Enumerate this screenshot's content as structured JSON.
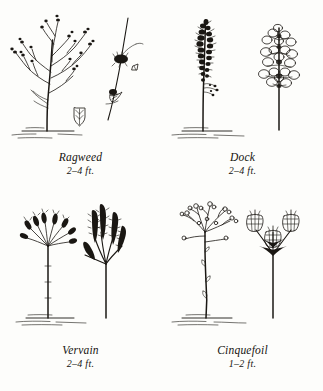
{
  "page": {
    "background_color": "#fdfdfb",
    "ink_color": "#1a1713",
    "layout": "2x2 grid of botanical plant illustrations with captions"
  },
  "panels": [
    {
      "id": "ragweed",
      "name": "Ragweed",
      "height": "2–4 ft.",
      "figure_main": "branching plant with slender upward branches tipped by small bead-like flower clusters",
      "figure_detail": "enlarged stem segment with two dark flower clusters and small bracts",
      "extra_detail": "small arrowhead-shaped leaf with veins",
      "ground_line": true
    },
    {
      "id": "dock",
      "name": "Dock",
      "height": "2–4 ft.",
      "figure_main": "tall straight stem with dense dark whorled seed clusters along upper portion",
      "figure_detail": "enlarged cluster of rounded winged seed pods on a thick stem",
      "ground_line": true
    },
    {
      "id": "vervain",
      "name": "Vervain",
      "height": "2–4 ft.",
      "figure_main": "bare vertical stem topped by a candelabra fan of upright flower spikes",
      "figure_detail": "enlarged group of five textured bumpy flower spikes radiating from one stalk",
      "ground_line": true
    },
    {
      "id": "cinquefoil",
      "name": "Cinquefoil",
      "height": "1–2 ft.",
      "figure_main": "thin stem with small leaf nubs branching at top into sprays of tiny round flower buds",
      "figure_detail": "three ribbed urn-shaped seed capsules on stalks above dark sepal bracts",
      "ground_line": true
    }
  ]
}
